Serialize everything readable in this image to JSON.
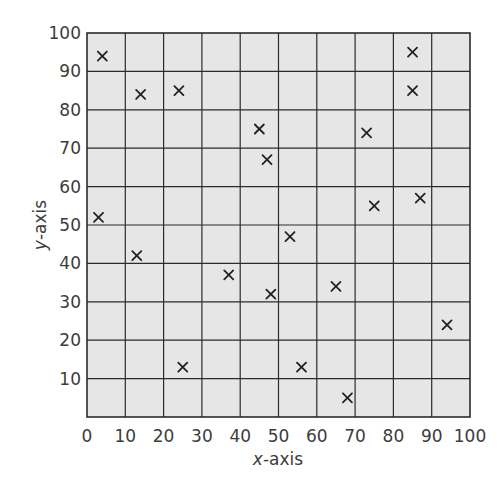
{
  "chart_data": {
    "type": "scatter",
    "title": "",
    "xlabel": "x-axis",
    "ylabel": "y-axis",
    "xlabel_parts": {
      "var": "x",
      "rest": "-axis"
    },
    "ylabel_parts": {
      "var": "y",
      "rest": "-axis"
    },
    "xlim": [
      0,
      100
    ],
    "ylim": [
      0,
      100
    ],
    "x_ticks": [
      0,
      10,
      20,
      30,
      40,
      50,
      60,
      70,
      80,
      90,
      100
    ],
    "y_ticks": [
      10,
      20,
      30,
      40,
      50,
      60,
      70,
      80,
      90,
      100
    ],
    "grid": true,
    "grid_step": 10,
    "marker": "x",
    "legend": null,
    "colors": {
      "plot_background": "#e6e6e6",
      "grid": "#2b2b2b",
      "marker": "#222222",
      "text": "#3c3c3c"
    },
    "series": [
      {
        "name": "points",
        "points": [
          {
            "x": 4,
            "y": 94
          },
          {
            "x": 14,
            "y": 84
          },
          {
            "x": 24,
            "y": 85
          },
          {
            "x": 3,
            "y": 52
          },
          {
            "x": 85,
            "y": 95
          },
          {
            "x": 85,
            "y": 85
          },
          {
            "x": 45,
            "y": 75
          },
          {
            "x": 73,
            "y": 74
          },
          {
            "x": 47,
            "y": 67
          },
          {
            "x": 87,
            "y": 57
          },
          {
            "x": 75,
            "y": 55
          },
          {
            "x": 53,
            "y": 47
          },
          {
            "x": 13,
            "y": 42
          },
          {
            "x": 37,
            "y": 37
          },
          {
            "x": 25,
            "y": 13
          },
          {
            "x": 48,
            "y": 32
          },
          {
            "x": 65,
            "y": 34
          },
          {
            "x": 94,
            "y": 24
          },
          {
            "x": 56,
            "y": 13
          },
          {
            "x": 68,
            "y": 5
          }
        ]
      }
    ]
  }
}
